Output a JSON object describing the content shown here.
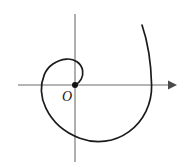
{
  "figure": {
    "title": "Spiral through origin with coordinate axes",
    "background_color": "#ffffff",
    "width": 188,
    "height": 166
  },
  "axes": {
    "color": "#6c6c6c",
    "x_axis": {
      "label": "",
      "start_x": 18,
      "end_x": 176,
      "y": 85,
      "has_arrow": true,
      "arrow_direction": "right"
    },
    "y_axis": {
      "label": "",
      "x": 75,
      "start_y": 14,
      "end_y": 162,
      "has_arrow": false
    }
  },
  "origin": {
    "label": "O",
    "dot_color": "#111111",
    "dot_radius": 3,
    "x": 75,
    "y": 85,
    "label_x": 67,
    "label_y": 100
  },
  "curve": {
    "name": "spiral",
    "color": "#1b1b1b",
    "stroke_width": 1.7,
    "description": "Archimedean spiral starting at the origin, winding counterclockwise outward for about one and three quarter turns, ending in the upper right",
    "turns": 1.75,
    "start_point": [
      75,
      85
    ],
    "end_point": [
      142,
      25
    ],
    "axis_crossings": {
      "inner_top_y": 62,
      "left_x": 36,
      "bottom_y": 148,
      "right_x": 149
    },
    "path": "M 75 85 C 80.5 82.5 83.5 76.5 82.5 70.5 C 81.2 63.2 74.5 58.5 66.5 59.2 C 56.5 60.1 48.0 66.0 44.5 74.5 C 40.2 85.0 41.0 97.5 46.0 108.0 C 52.5 121.8 65.0 132.5 79.5 138.0 C 96.0 144.2 114.5 142.0 128.5 132.0 C 143.5 121.3 152.0 103.5 151.5 85.0 C 151.0 64.5 148.0 42.5 142.0 25.0"
  }
}
